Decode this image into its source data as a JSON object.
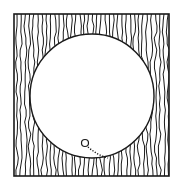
{
  "diagram": {
    "colors": {
      "stroke": "#1a1a1a",
      "background": "#ffffff"
    },
    "square": {
      "x": 14,
      "y": 14,
      "width": 155,
      "height": 162
    },
    "circle": {
      "cx": 92,
      "cy": 96,
      "r": 62
    },
    "small_circle": {
      "cx": 85,
      "cy": 143,
      "r": 3.5
    },
    "dotted_path": {
      "from": [
        88,
        147
      ],
      "to": [
        108,
        158
      ]
    }
  }
}
